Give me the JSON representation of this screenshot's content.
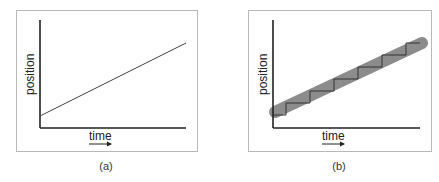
{
  "panels": [
    {
      "id": "a",
      "caption": "(a)",
      "xlabel": "time",
      "ylabel": "position",
      "description": "Straight line: position increases linearly with time"
    },
    {
      "id": "b",
      "caption": "(b)",
      "xlabel": "time",
      "ylabel": "position",
      "description": "Staircase trace inside a thick gray band: stepwise motion that on average is linear"
    }
  ],
  "colors": {
    "axis": "#222222",
    "line": "#444444",
    "band": "#8c8c8c",
    "frame": "#b8b8b8"
  }
}
